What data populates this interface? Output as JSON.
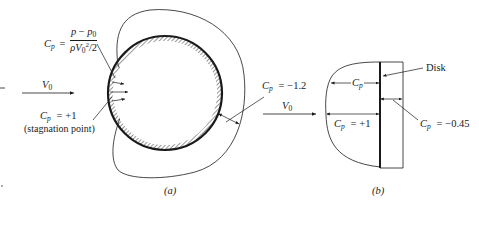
{
  "figure": {
    "panel_a": {
      "caption": "(a)",
      "cp_symbol": "C",
      "cp_sub": "p",
      "equals": "=",
      "formula_num_p": "p",
      "formula_minus": "−",
      "formula_p0": "p",
      "formula_p0_sub": "0",
      "formula_den_rho": "ρV",
      "formula_den_sub": "0",
      "formula_den_sup": "2",
      "formula_den_tail": "/2",
      "stagnation_value": "+1",
      "stagnation_note": "(stagnation point)",
      "side_value": "−1.2",
      "freestream_label": "V",
      "freestream_sub": "0"
    },
    "panel_b": {
      "caption": "(b)",
      "disk_label": "Disk",
      "freestream_label": "V",
      "freestream_sub": "0",
      "cp_symbol": "C",
      "cp_sub": "p",
      "front_value": "+1",
      "back_value": "−0.45",
      "equals": "="
    },
    "colors": {
      "ink": "#1a1a1a",
      "background": "#ffffff"
    }
  }
}
